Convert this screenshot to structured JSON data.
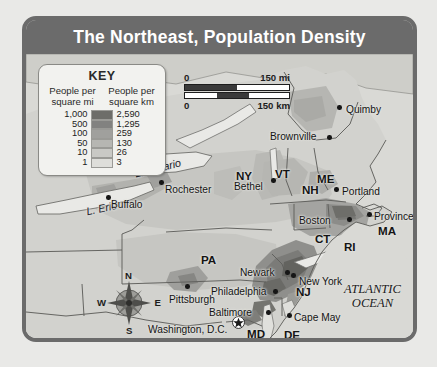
{
  "title": "The Northeast, Population Density",
  "key": {
    "heading": "KEY",
    "col_mi_line1": "People per",
    "col_mi_line2": "square mi",
    "col_km_line1": "People per",
    "col_km_line2": "square km",
    "rows": [
      {
        "mi": "1,000",
        "km": "2,590",
        "color": "#6d6d69"
      },
      {
        "mi": "500",
        "km": "1,295",
        "color": "#828280"
      },
      {
        "mi": "100",
        "km": "259",
        "color": "#a0a09d"
      },
      {
        "mi": "50",
        "km": "130",
        "color": "#b6b6b2"
      },
      {
        "mi": "10",
        "km": "26",
        "color": "#c9c9c5"
      },
      {
        "mi": "1",
        "km": "3",
        "color": "#dededa"
      }
    ]
  },
  "scale": {
    "mi_zero": "0",
    "mi_max": "150 mi",
    "km_zero": "0",
    "km_max": "150 km"
  },
  "compass": {
    "n": "N",
    "e": "E",
    "s": "S",
    "w": "W"
  },
  "ocean_label": {
    "line1": "ATLANTIC",
    "line2": "OCEAN"
  },
  "water_labels": [
    {
      "name": "L. Ontario",
      "x": 108,
      "y": 108,
      "rot": -14
    },
    {
      "name": "L. Erie",
      "x": 60,
      "y": 148,
      "rot": -12
    }
  ],
  "states": [
    {
      "abbr": "ME",
      "x": 291,
      "y": 118
    },
    {
      "abbr": "VT",
      "x": 249,
      "y": 113
    },
    {
      "abbr": "NH",
      "x": 276,
      "y": 129
    },
    {
      "abbr": "NY",
      "x": 210,
      "y": 115
    },
    {
      "abbr": "MA",
      "x": 352,
      "y": 170
    },
    {
      "abbr": "CT",
      "x": 289,
      "y": 178
    },
    {
      "abbr": "RI",
      "x": 318,
      "y": 186
    },
    {
      "abbr": "PA",
      "x": 175,
      "y": 199
    },
    {
      "abbr": "NJ",
      "x": 270,
      "y": 231
    },
    {
      "abbr": "MD",
      "x": 221,
      "y": 273
    },
    {
      "abbr": "DE",
      "x": 258,
      "y": 274
    }
  ],
  "cities": [
    {
      "name": "Quimby",
      "lx": 320,
      "ly": 50,
      "dx": 311,
      "dy": 51,
      "anchor": "left"
    },
    {
      "name": "Brownville",
      "lx": 244,
      "ly": 77,
      "dx": 301,
      "dy": 81,
      "anchor": "left"
    },
    {
      "name": "Portland",
      "lx": 316,
      "ly": 132,
      "dx": 308,
      "dy": 133,
      "anchor": "left"
    },
    {
      "name": "Bethel",
      "lx": 208,
      "ly": 127,
      "dx": 245,
      "dy": 124,
      "anchor": "left"
    },
    {
      "name": "Rochester",
      "lx": 139,
      "ly": 130,
      "dx": 133,
      "dy": 126,
      "anchor": "left"
    },
    {
      "name": "Buffalo",
      "lx": 85,
      "ly": 145,
      "dx": 80,
      "dy": 141,
      "anchor": "left"
    },
    {
      "name": "Boston",
      "lx": 273,
      "ly": 161,
      "dx": 321,
      "dy": 163,
      "anchor": "left"
    },
    {
      "name": "Provincetown",
      "lx": 348,
      "ly": 157,
      "dx": 341,
      "dy": 158,
      "anchor": "left"
    },
    {
      "name": "Newark",
      "lx": 214,
      "ly": 213,
      "dx": 259,
      "dy": 216,
      "anchor": "left"
    },
    {
      "name": "New York",
      "lx": 273,
      "ly": 222,
      "dx": 265,
      "dy": 219,
      "anchor": "left"
    },
    {
      "name": "Philadelphia",
      "lx": 185,
      "ly": 232,
      "dx": 247,
      "dy": 235,
      "anchor": "left"
    },
    {
      "name": "Pittsburgh",
      "lx": 143,
      "ly": 240,
      "dx": 159,
      "dy": 230,
      "anchor": "left"
    },
    {
      "name": "Baltimore",
      "lx": 183,
      "ly": 253,
      "dx": 240,
      "dy": 256,
      "anchor": "left"
    },
    {
      "name": "Washington, D.C.",
      "lx": 122,
      "ly": 270,
      "dx": 0,
      "dy": 0,
      "anchor": "left"
    },
    {
      "name": "Cape May",
      "lx": 268,
      "ly": 258,
      "dx": 261,
      "dy": 259,
      "anchor": "left"
    }
  ]
}
